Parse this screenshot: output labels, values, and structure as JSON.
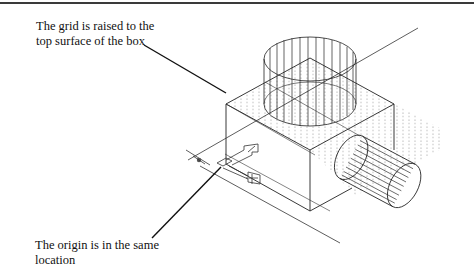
{
  "figure": {
    "type": "isometric CAD wireframe",
    "annotations": {
      "grid_label": {
        "lines": [
          "The grid is raised to the",
          "top surface of the box"
        ]
      },
      "origin_label": {
        "lines": [
          "The origin is in the same",
          "location"
        ]
      }
    },
    "objects": [
      {
        "name": "box",
        "description": "isometric box with dotted grid on top surface"
      },
      {
        "name": "vertical-cylinder",
        "description": "wireframe cylinder on top of box"
      },
      {
        "name": "horizontal-cylinder",
        "description": "wireframe cylinder protruding from box side"
      },
      {
        "name": "ucs-icon",
        "description": "user coordinate system icon at box base"
      },
      {
        "name": "origin-marker",
        "description": "crosshair origin marker"
      }
    ],
    "colors": {
      "line": "#222222",
      "grid_dot": "#9a9a9a",
      "rule": "#3a3a3a",
      "background": "#ffffff"
    }
  }
}
